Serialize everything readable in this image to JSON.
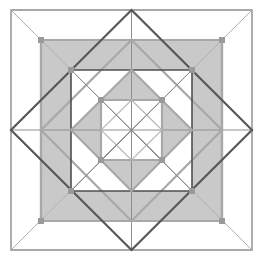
{
  "figure": {
    "type": "geometric-line-figure",
    "canvas": {
      "width": 263,
      "height": 258
    },
    "background_color": "#ffffff",
    "center": {
      "x": 131.5,
      "y": 130
    },
    "colors": {
      "outer_border_stroke": "#8c8c8c",
      "thin_diagonal_stroke": "#b0b0b0",
      "dark_diamond_stroke": "#585858",
      "mid_square_stroke": "#4f4f4f",
      "gray_shape_stroke": "#a8a8a8",
      "inner_light_stroke": "#b8b8b8",
      "fill_gray": "#c9c9c9",
      "fill_gray_light": "#d2d2d2",
      "vertex_marker": "#9a9a9a"
    },
    "shapes": [
      {
        "name": "outer-border-square",
        "role": "outermost bounding square",
        "points": "11,10 252,10 252,250 11,250",
        "fill": "none",
        "stroke": "#8c8c8c",
        "stroke_width": 1.4
      },
      {
        "name": "outer-corner-diagonals",
        "role": "thin diagonals from outer square corners to big diamond vertices",
        "segments": [
          "11,10 252,250",
          "252,10 11,250"
        ],
        "stroke": "#b0b0b0",
        "stroke_width": 1
      },
      {
        "name": "gray-filled-square",
        "role": "large gray filled square inset from border",
        "points": "41,40 222,40 222,221 41,221",
        "fill": "#c9c9c9",
        "stroke": "#a8a8a8",
        "stroke_width": 2.2
      },
      {
        "name": "large-dark-diamond",
        "role": "large rotated square touching midpoints of outer border",
        "points": "131.5,10 252,130 131.5,250 11,130",
        "fill": "none",
        "stroke": "#585858",
        "stroke_width": 2.2
      },
      {
        "name": "middle-square",
        "role": "middle square inscribed in large diamond",
        "points": "71,70 192,70 192,191 71,191",
        "fill": "none",
        "stroke": "#4f4f4f",
        "stroke_width": 1.6
      },
      {
        "name": "middle-gray-diamond",
        "role": "gray diamond inscribed in middle square",
        "points": "131.5,70 192,130 131.5,191 71,130",
        "fill": "#ffffff",
        "stroke": "#a8a8a8",
        "stroke_width": 2.2
      },
      {
        "name": "inner-gray-square",
        "role": "inner square with gray stroke",
        "points": "101,100 162,100 162,160 101,160",
        "fill": "#ffffff",
        "stroke": "#a8a8a8",
        "stroke_width": 2.2
      },
      {
        "name": "innermost-diamond",
        "role": "smallest rotated square at center",
        "points": "131.5,100 162,130 131.5,160 101,130",
        "fill": "none",
        "stroke": "#b8b8b8",
        "stroke_width": 1.2
      },
      {
        "name": "central-cross-and-diagonals",
        "role": "axes and diagonals radiating from the center",
        "segments": [
          "11,130 252,130",
          "131.5,10 131.5,250",
          "71,70 192,191",
          "192,70 71,191"
        ],
        "stroke": "#8e8e8e",
        "stroke_width": 1
      }
    ],
    "vertex_markers": [
      {
        "x": 41,
        "y": 40
      },
      {
        "x": 222,
        "y": 40
      },
      {
        "x": 41,
        "y": 221
      },
      {
        "x": 222,
        "y": 221
      },
      {
        "x": 71,
        "y": 70
      },
      {
        "x": 192,
        "y": 70
      },
      {
        "x": 71,
        "y": 191
      },
      {
        "x": 192,
        "y": 191
      },
      {
        "x": 101,
        "y": 100
      },
      {
        "x": 162,
        "y": 100
      },
      {
        "x": 101,
        "y": 160
      },
      {
        "x": 162,
        "y": 160
      }
    ]
  }
}
